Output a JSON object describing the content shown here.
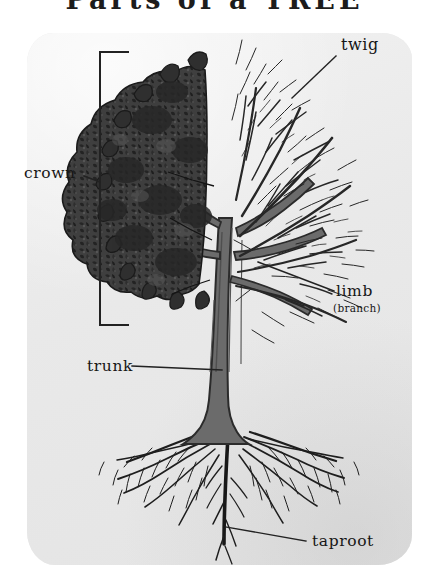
{
  "figure": {
    "title": "Parts of a TREE",
    "medium": "pencil-and-ink drawing on paper"
  },
  "labels": {
    "crown": "crown",
    "twig": "twig",
    "limb": "limb",
    "limb_alt": "(branch)",
    "trunk": "trunk",
    "taproot": "taproot"
  },
  "colors": {
    "paper": "#ececec",
    "page_background": "#ffffff",
    "foliage": "#3a3a3a",
    "trunk_fill": "#6b6b6b",
    "branch_ink": "#2b2b2b",
    "label_ink": "#161616",
    "leader_line": "#2a2a2a"
  }
}
